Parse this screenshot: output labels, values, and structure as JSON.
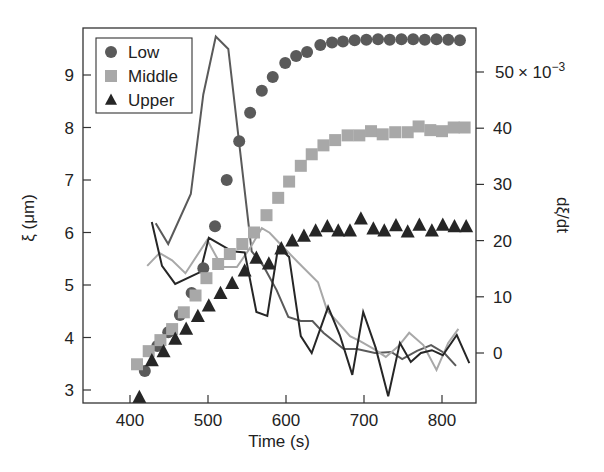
{
  "chart_data": {
    "type": "scatter",
    "title": "",
    "xlabel": "Time (s)",
    "ylabel": "ξ (μm)",
    "y2label": "dξ/dt",
    "y2_multiplier_label": "× 10",
    "y2_multiplier_exp": "−3",
    "xlim": [
      338,
      843
    ],
    "ylim": [
      2.75,
      9.95
    ],
    "y2lim": [
      -8.9,
      55.8
    ],
    "xticks": [
      400,
      500,
      600,
      700,
      800
    ],
    "yticks": [
      3,
      4,
      5,
      6,
      7,
      8,
      9
    ],
    "y2ticks": [
      0,
      10,
      20,
      30,
      40,
      50
    ],
    "grid": false,
    "legend_position": "upper left",
    "series": [
      {
        "name": "Low",
        "marker": "circle",
        "color": "#5a5a5a",
        "x": [
          419,
          435,
          449,
          464,
          479,
          494,
          509,
          524,
          540,
          554,
          569,
          583,
          599,
          613,
          627,
          644,
          659,
          673,
          688,
          703,
          718,
          733,
          748,
          763,
          778,
          793,
          808,
          823
        ],
        "y": [
          3.36,
          3.84,
          4.1,
          4.43,
          4.85,
          5.32,
          6.12,
          7.0,
          7.74,
          8.28,
          8.7,
          8.96,
          9.23,
          9.36,
          9.44,
          9.57,
          9.62,
          9.64,
          9.66,
          9.67,
          9.68,
          9.67,
          9.68,
          9.68,
          9.67,
          9.68,
          9.67,
          9.66
        ]
      },
      {
        "name": "Middle",
        "marker": "square",
        "color": "#a8a8a8",
        "x": [
          409,
          424,
          439,
          454,
          469,
          484,
          498,
          513,
          528,
          544,
          559,
          575,
          590,
          604,
          619,
          633,
          648,
          663,
          679,
          694,
          709,
          724,
          740,
          756,
          770,
          785,
          800,
          815,
          829
        ],
        "y": [
          3.49,
          3.74,
          3.95,
          4.16,
          4.48,
          4.8,
          5.13,
          5.4,
          5.59,
          5.78,
          6.0,
          6.33,
          6.66,
          6.97,
          7.27,
          7.49,
          7.66,
          7.76,
          7.85,
          7.85,
          7.93,
          7.87,
          7.91,
          7.91,
          8.02,
          7.95,
          7.93,
          8.0,
          8.0
        ]
      },
      {
        "name": "Upper",
        "marker": "triangle",
        "color": "#262626",
        "x": [
          412,
          428,
          443,
          458,
          472,
          487,
          501,
          516,
          531,
          547,
          562,
          578,
          594,
          608,
          623,
          638,
          653,
          667,
          682,
          696,
          712,
          726,
          741,
          756,
          771,
          787,
          801,
          816,
          831
        ],
        "y": [
          2.86,
          3.56,
          3.73,
          3.97,
          4.16,
          4.4,
          4.6,
          4.84,
          5.03,
          5.27,
          5.51,
          5.4,
          5.69,
          5.84,
          5.93,
          6.03,
          6.11,
          6.03,
          6.03,
          6.26,
          6.07,
          6.03,
          6.13,
          6.01,
          6.14,
          6.03,
          6.14,
          6.11,
          6.11
        ]
      }
    ],
    "derivative_series": [
      {
        "name": "dξ/dt Low",
        "style": "line",
        "color": "#5a5a5a",
        "x": [
          433,
          449,
          478,
          494,
          510,
          526,
          556,
          571,
          588,
          603,
          619,
          634,
          648,
          674,
          691,
          714,
          735,
          749,
          768,
          786,
          803,
          818
        ],
        "y": [
          23.1,
          19.4,
          28.3,
          46.0,
          56.3,
          54.1,
          18.1,
          15.5,
          11.2,
          6.4,
          5.7,
          5.7,
          3.6,
          0.7,
          0.7,
          0.0,
          0.2,
          -1.1,
          0.4,
          1.4,
          -0.0,
          -2.3
        ]
      },
      {
        "name": "dξ/dt Middle",
        "style": "line",
        "color": "#a8a8a8",
        "x": [
          422,
          438,
          454,
          471,
          499,
          518,
          537,
          554,
          569,
          579,
          596,
          615,
          641,
          653,
          665,
          682,
          695,
          713,
          728,
          744,
          758,
          776,
          793,
          808,
          821
        ],
        "y": [
          15.5,
          17.8,
          16.5,
          14.2,
          20.1,
          15.3,
          15.3,
          18.7,
          22.2,
          21.4,
          18.9,
          16.2,
          12.6,
          7.5,
          5.7,
          3.0,
          2.1,
          0.7,
          -0.7,
          1.2,
          3.6,
          1.4,
          -3.0,
          1.8,
          4.3
        ]
      },
      {
        "name": "dξ/dt Upper",
        "style": "line",
        "color": "#262626",
        "x": [
          428,
          441,
          458,
          490,
          501,
          531,
          547,
          562,
          576,
          590,
          604,
          619,
          633,
          654,
          669,
          685,
          699,
          715,
          731,
          746,
          760,
          773,
          787,
          801,
          819,
          835
        ],
        "y": [
          23.3,
          15.5,
          12.3,
          14.4,
          20.5,
          18.1,
          17.9,
          7.3,
          6.6,
          18.9,
          17.1,
          3.0,
          0.0,
          8.2,
          3.2,
          -3.9,
          7.3,
          0.9,
          -7.7,
          1.8,
          -1.6,
          0.0,
          0.5,
          -0.4,
          3.2,
          -1.8
        ]
      }
    ]
  },
  "legend": {
    "items": [
      {
        "label": "Low",
        "marker": "circle",
        "color": "#5a5a5a"
      },
      {
        "label": "Middle",
        "marker": "square",
        "color": "#a8a8a8"
      },
      {
        "label": "Upper",
        "marker": "triangle",
        "color": "#262626"
      }
    ]
  },
  "axes": {
    "x_title": "Time (s)",
    "y_title": "ξ (μm)",
    "y2_title": "dξ/dt",
    "y2_top_label_prefix": "50",
    "y2_top_label_times": "× 10",
    "y2_top_label_exp": "−3"
  }
}
